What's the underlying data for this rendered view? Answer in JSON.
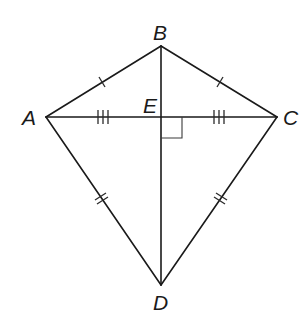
{
  "diagram": {
    "type": "kite",
    "points": {
      "A": {
        "label": "A",
        "x": 46,
        "y": 117
      },
      "B": {
        "label": "B",
        "x": 161,
        "y": 46
      },
      "C": {
        "label": "C",
        "x": 277,
        "y": 117
      },
      "D": {
        "label": "D",
        "x": 161,
        "y": 285
      },
      "E": {
        "label": "E",
        "x": 161,
        "y": 117
      }
    },
    "segments": [
      {
        "name": "AB",
        "marks": 1
      },
      {
        "name": "BC",
        "marks": 1
      },
      {
        "name": "AD",
        "marks": 2
      },
      {
        "name": "CD",
        "marks": 2
      },
      {
        "name": "AE",
        "marks": 3
      },
      {
        "name": "EC",
        "marks": 3
      },
      {
        "name": "BD",
        "marks": 0
      }
    ],
    "right_angle_at": "E",
    "stroke_color": "#1a1a1a",
    "background": "#ffffff"
  }
}
